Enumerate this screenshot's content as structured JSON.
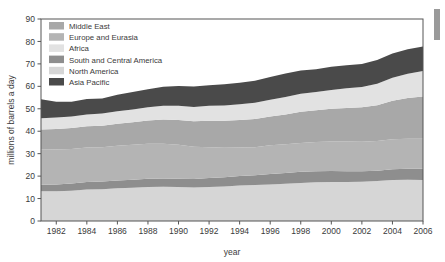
{
  "figure": {
    "name": "world-oil-consumption-stacked-area-chart",
    "background_color": "#ffffff"
  },
  "axes": {
    "y": {
      "label": "millions of barrels a day",
      "ticks": [
        "0",
        "10",
        "20",
        "30",
        "40",
        "50",
        "60",
        "70",
        "80",
        "90"
      ],
      "min": 0,
      "max": 90
    },
    "x": {
      "label": "year",
      "ticks": [
        "1982",
        "1984",
        "1986",
        "1988",
        "1990",
        "1992",
        "1994",
        "1996",
        "1998",
        "2000",
        "2002",
        "2004",
        "2006"
      ],
      "min": 1981,
      "max": 2006
    }
  },
  "legend": {
    "items": [
      {
        "label": "Middle East",
        "color": "#a8a8a8"
      },
      {
        "label": "Europe and Eurasia",
        "color": "#b4b4b4"
      },
      {
        "label": "Africa",
        "color": "#e2e2e2"
      },
      {
        "label": "South and Central America",
        "color": "#8e8e8e"
      },
      {
        "label": "North America",
        "color": "#d6d6d6"
      },
      {
        "label": "Asia Pacific",
        "color": "#4a4a4a"
      }
    ]
  },
  "chart_data": {
    "type": "area",
    "title": "",
    "xlabel": "year",
    "ylabel": "millions of barrels a day",
    "xlim": [
      1981,
      2006
    ],
    "ylim": [
      0,
      90
    ],
    "grid": false,
    "legend_position": "top-left",
    "stacked": true,
    "stack_order_bottom_to_top": [
      "North America",
      "South and Central America",
      "Europe and Eurasia",
      "Middle East",
      "Africa",
      "Asia Pacific"
    ],
    "x": [
      1981,
      1982,
      1983,
      1984,
      1985,
      1986,
      1987,
      1988,
      1989,
      1990,
      1991,
      1992,
      1993,
      1994,
      1995,
      1996,
      1997,
      1998,
      1999,
      2000,
      2001,
      2002,
      2003,
      2004,
      2005,
      2006
    ],
    "series": [
      {
        "name": "North America",
        "color": "#d6d6d6",
        "values": [
          13.3,
          13.3,
          13.5,
          14.0,
          14.2,
          14.6,
          14.8,
          15.2,
          15.3,
          15.1,
          14.9,
          15.2,
          15.4,
          15.8,
          16.0,
          16.3,
          16.6,
          16.9,
          17.3,
          17.4,
          17.4,
          17.5,
          17.8,
          18.3,
          18.4,
          18.3
        ],
        "stack_top_at_start": 13.3,
        "stack_top_at_end": 18.3
      },
      {
        "name": "South and Central America",
        "color": "#8e8e8e",
        "values": [
          2.8,
          3.0,
          3.2,
          3.4,
          3.4,
          3.5,
          3.6,
          3.6,
          3.6,
          3.7,
          3.8,
          4.0,
          4.1,
          4.3,
          4.4,
          4.6,
          4.8,
          5.0,
          4.9,
          4.9,
          4.8,
          4.7,
          4.6,
          4.8,
          4.9,
          5.0
        ],
        "stack_top_at_start": 16.1,
        "stack_top_at_end": 23.3
      },
      {
        "name": "Europe and Eurasia",
        "color": "#b4b4b4",
        "values": [
          15.9,
          15.6,
          15.4,
          15.3,
          15.3,
          15.4,
          15.6,
          15.6,
          15.5,
          15.2,
          14.4,
          13.7,
          13.1,
          12.6,
          12.5,
          12.8,
          12.8,
          12.9,
          13.0,
          13.1,
          13.2,
          13.1,
          13.2,
          13.3,
          13.3,
          13.3
        ],
        "stack_top_at_start": 32.0,
        "stack_top_at_end": 36.6
      },
      {
        "name": "Middle East",
        "color": "#a8a8a8",
        "values": [
          8.8,
          9.1,
          9.3,
          9.5,
          9.5,
          9.8,
          10.0,
          10.4,
          10.8,
          11.0,
          11.3,
          11.8,
          12.1,
          12.3,
          12.6,
          12.9,
          13.3,
          13.9,
          14.1,
          14.6,
          15.0,
          15.4,
          16.0,
          17.2,
          18.2,
          18.9
        ],
        "stack_top_at_start": 40.8,
        "stack_top_at_end": 55.5
      },
      {
        "name": "Africa",
        "color": "#e2e2e2",
        "values": [
          5.0,
          5.1,
          5.2,
          5.3,
          5.5,
          5.6,
          5.7,
          5.9,
          6.1,
          6.3,
          6.4,
          6.6,
          6.8,
          7.0,
          7.2,
          7.4,
          7.7,
          8.0,
          8.2,
          8.4,
          8.8,
          9.0,
          9.5,
          10.2,
          10.8,
          11.3
        ],
        "stack_top_at_start": 45.8,
        "stack_top_at_end": 66.8
      },
      {
        "name": "Asia Pacific",
        "color": "#4a4a4a",
        "values": [
          8.5,
          7.0,
          6.5,
          6.9,
          6.7,
          7.3,
          7.8,
          8.0,
          8.5,
          8.8,
          9.1,
          9.2,
          9.4,
          9.6,
          9.8,
          10.2,
          10.5,
          10.4,
          10.1,
          10.3,
          10.2,
          10.3,
          10.6,
          10.8,
          10.9,
          11.0
        ],
        "stack_top_at_start": 54.3,
        "stack_top_at_end": 77.8
      }
    ],
    "stack_totals": [
      54.3,
      53.1,
      53.1,
      54.4,
      54.6,
      56.2,
      57.5,
      58.7,
      59.8,
      60.1,
      59.9,
      60.5,
      60.9,
      61.6,
      62.5,
      64.2,
      65.7,
      67.1,
      67.6,
      68.7,
      69.4,
      70.0,
      71.7,
      74.6,
      76.5,
      77.8
    ]
  }
}
